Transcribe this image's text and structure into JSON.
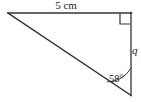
{
  "figure": {
    "kind": "geometry-diagram",
    "shape": "right-triangle",
    "background_color": "#ffffff",
    "stroke_color": "#333333",
    "text_color": "#1a1a1a"
  },
  "labels": {
    "top_side": "5 cm",
    "right_side": "q",
    "angle": "58°"
  },
  "geometry": {
    "vertices": {
      "left": {
        "x": 8,
        "y": 13
      },
      "top_right": {
        "x": 131,
        "y": 13
      },
      "bottom_right": {
        "x": 131,
        "y": 95
      }
    },
    "right_angle_marker": {
      "at": "top_right",
      "size": 11
    },
    "angle_arc": {
      "at": "bottom_right",
      "radius": 27,
      "value_degrees": 58
    },
    "sides": {
      "top": {
        "label": "5 cm",
        "length_value": 5,
        "length_unit": "cm"
      },
      "right": {
        "label": "q",
        "length_value": null,
        "length_unit": null
      },
      "hypotenuse": {
        "label": "",
        "length_value": null,
        "length_unit": null
      }
    }
  },
  "icons": {
    "right_angle": "right-angle-marker-icon",
    "angle_arc": "angle-arc-icon"
  }
}
